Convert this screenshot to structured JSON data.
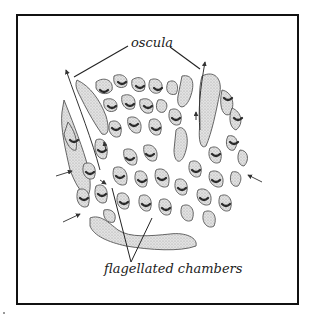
{
  "figure": {
    "labels": {
      "oscula": "oscula",
      "flagellated_chambers": "flagellated chambers"
    },
    "colors": {
      "frame": "#111111",
      "tissue_fill": "#d9d9d9",
      "tissue_stroke": "#555555",
      "chamber": "#333333",
      "arrow": "#333333",
      "background": "#ffffff"
    },
    "arrows": {
      "incoming_water": 4,
      "outgoing_oscula": 2
    }
  }
}
